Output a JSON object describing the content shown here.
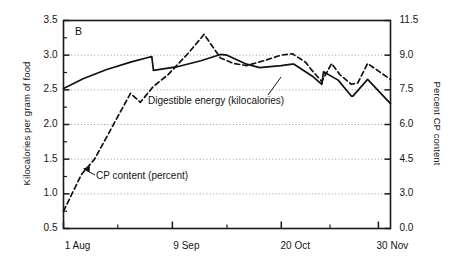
{
  "panel": {
    "letter": "B"
  },
  "axes": {
    "left_title": "Kilocalories per gram of food",
    "right_title": "Percent CP content",
    "left_ticks": [
      "3.5",
      "3.0",
      "2.5",
      "2.0",
      "1.5",
      "1.0",
      "0.5"
    ],
    "right_ticks": [
      "11.5",
      "9.0",
      "7.5",
      "6.0",
      "4.5",
      "3.0",
      "0.0"
    ],
    "x_ticks": [
      "1 Aug",
      "9 Sep",
      "20 Oct",
      "30 Nov"
    ]
  },
  "annotations": {
    "digestible_energy": "Digestible energy (kilocalories)",
    "cp_content": "CP content (percent)"
  },
  "colors": {
    "axis": "#1a1a1a",
    "grid": "#9a9a9a",
    "series_solid": "#111111",
    "series_dashed": "#111111",
    "background": "#ffffff"
  },
  "chart_data": {
    "type": "line",
    "title": "B",
    "xlabel": "",
    "ylabel": "Kilocalories per gram of food",
    "y2label": "Percent CP content",
    "ylim": [
      0.5,
      3.5
    ],
    "y2lim": [
      0.0,
      11.5
    ],
    "ytick_values": [
      0.5,
      1.0,
      1.5,
      2.0,
      2.5,
      3.0,
      3.5
    ],
    "y2tick_values": [
      0.0,
      3.0,
      4.5,
      6.0,
      7.5,
      9.0,
      11.5
    ],
    "y2tick_labels": [
      "0.0",
      "3.0",
      "4.5",
      "6.0",
      "7.5",
      "9.0",
      "11.5"
    ],
    "grid": "horizontal-dotted",
    "gridline_values": [
      1.0,
      1.5,
      2.0,
      2.5,
      3.0
    ],
    "legend": "inline-annotations",
    "x_tick_labels": [
      "1 Aug",
      "9 Sep",
      "20 Oct",
      "30 Nov"
    ],
    "x_tick_fractions": [
      0.0,
      0.333,
      0.666,
      0.963
    ],
    "x_minor_tick_fractions": [
      0.166,
      0.5,
      0.815
    ],
    "series": [
      {
        "name": "Digestible energy (kilocalories)",
        "axis": "left",
        "style": "solid",
        "x": [
          0.0,
          0.06,
          0.13,
          0.205,
          0.27,
          0.275,
          0.345,
          0.42,
          0.48,
          0.5,
          0.56,
          0.6,
          0.665,
          0.7,
          0.705,
          0.76,
          0.79,
          0.795,
          0.84,
          0.88,
          0.885,
          0.93,
          1.0
        ],
        "values": [
          2.52,
          2.66,
          2.79,
          2.9,
          2.98,
          2.78,
          2.83,
          2.92,
          3.01,
          3.0,
          2.87,
          2.82,
          2.85,
          2.87,
          2.87,
          2.7,
          2.58,
          2.76,
          2.64,
          2.41,
          2.41,
          2.65,
          2.3
        ],
        "units": "kcal/g"
      },
      {
        "name": "CP content (percent)",
        "axis": "right",
        "style": "dashed",
        "x": [
          0.0,
          0.055,
          0.095,
          0.205,
          0.235,
          0.275,
          0.32,
          0.38,
          0.43,
          0.48,
          0.52,
          0.56,
          0.62,
          0.665,
          0.7,
          0.74,
          0.76,
          0.79,
          0.82,
          0.845,
          0.88,
          0.9,
          0.93,
          1.0
        ],
        "values_left_scale": [
          0.75,
          1.28,
          1.5,
          2.45,
          2.32,
          2.55,
          2.72,
          3.02,
          3.3,
          2.96,
          2.88,
          2.85,
          2.93,
          3.0,
          3.02,
          2.9,
          2.78,
          2.62,
          2.88,
          2.72,
          2.58,
          2.6,
          2.88,
          2.65
        ],
        "values": [
          1.5,
          3.45,
          4.28,
          7.75,
          7.27,
          8.12,
          8.75,
          9.83,
          10.85,
          9.6,
          9.3,
          9.2,
          9.48,
          9.73,
          9.8,
          9.35,
          8.9,
          8.3,
          9.28,
          8.7,
          8.18,
          8.25,
          9.28,
          8.45
        ],
        "units": "percent"
      }
    ]
  }
}
